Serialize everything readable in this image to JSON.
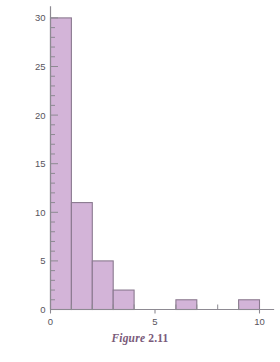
{
  "caption": {
    "word": "Figure",
    "number": "2.11"
  },
  "colors": {
    "bar_fill": "#d3b4d8",
    "bar_stroke": "#8b7a90",
    "axis": "#8d8a92",
    "tick_text": "#58545c",
    "caption": "#7a5a7a",
    "background": "#ffffff"
  },
  "chart_data": {
    "type": "bar",
    "title": "",
    "subtitle": "",
    "xlabel": "",
    "ylabel": "",
    "xlim": [
      -0.55,
      10.7
    ],
    "ylim": [
      0,
      31.2
    ],
    "grid": false,
    "legend": null,
    "legend_position": "none",
    "bin_width": 1,
    "annotations": [],
    "x_ticks_major": [
      0,
      5,
      10
    ],
    "x_tick_labels": [
      "0",
      "5",
      "10"
    ],
    "x_ticks_minor": [
      1,
      2,
      3,
      4,
      6,
      7,
      8,
      9
    ],
    "y_ticks_major": [
      0,
      5,
      10,
      15,
      20,
      25,
      30
    ],
    "y_tick_labels": [
      "0",
      "5",
      "10",
      "15",
      "20",
      "25",
      "30"
    ],
    "y_ticks_minor": [
      1,
      2,
      3,
      4,
      6,
      7,
      8,
      9,
      11,
      12,
      13,
      14,
      16,
      17,
      18,
      19,
      21,
      22,
      23,
      24,
      26,
      27,
      28,
      29
    ],
    "categories": [
      "0-1",
      "1-2",
      "2-3",
      "3-4",
      "4-5",
      "5-6",
      "6-7",
      "7-8",
      "8-9",
      "9-10"
    ],
    "bins": [
      {
        "x0": 0,
        "x1": 1,
        "value": 30
      },
      {
        "x0": 1,
        "x1": 2,
        "value": 11
      },
      {
        "x0": 2,
        "x1": 3,
        "value": 5
      },
      {
        "x0": 3,
        "x1": 4,
        "value": 2
      },
      {
        "x0": 4,
        "x1": 5,
        "value": 0
      },
      {
        "x0": 5,
        "x1": 6,
        "value": 0
      },
      {
        "x0": 6,
        "x1": 7,
        "value": 1
      },
      {
        "x0": 7,
        "x1": 8,
        "value": 0
      },
      {
        "x0": 8,
        "x1": 9,
        "value": 0
      },
      {
        "x0": 9,
        "x1": 10,
        "value": 1
      }
    ],
    "values": [
      30,
      11,
      5,
      2,
      0,
      0,
      1,
      0,
      0,
      1
    ]
  }
}
